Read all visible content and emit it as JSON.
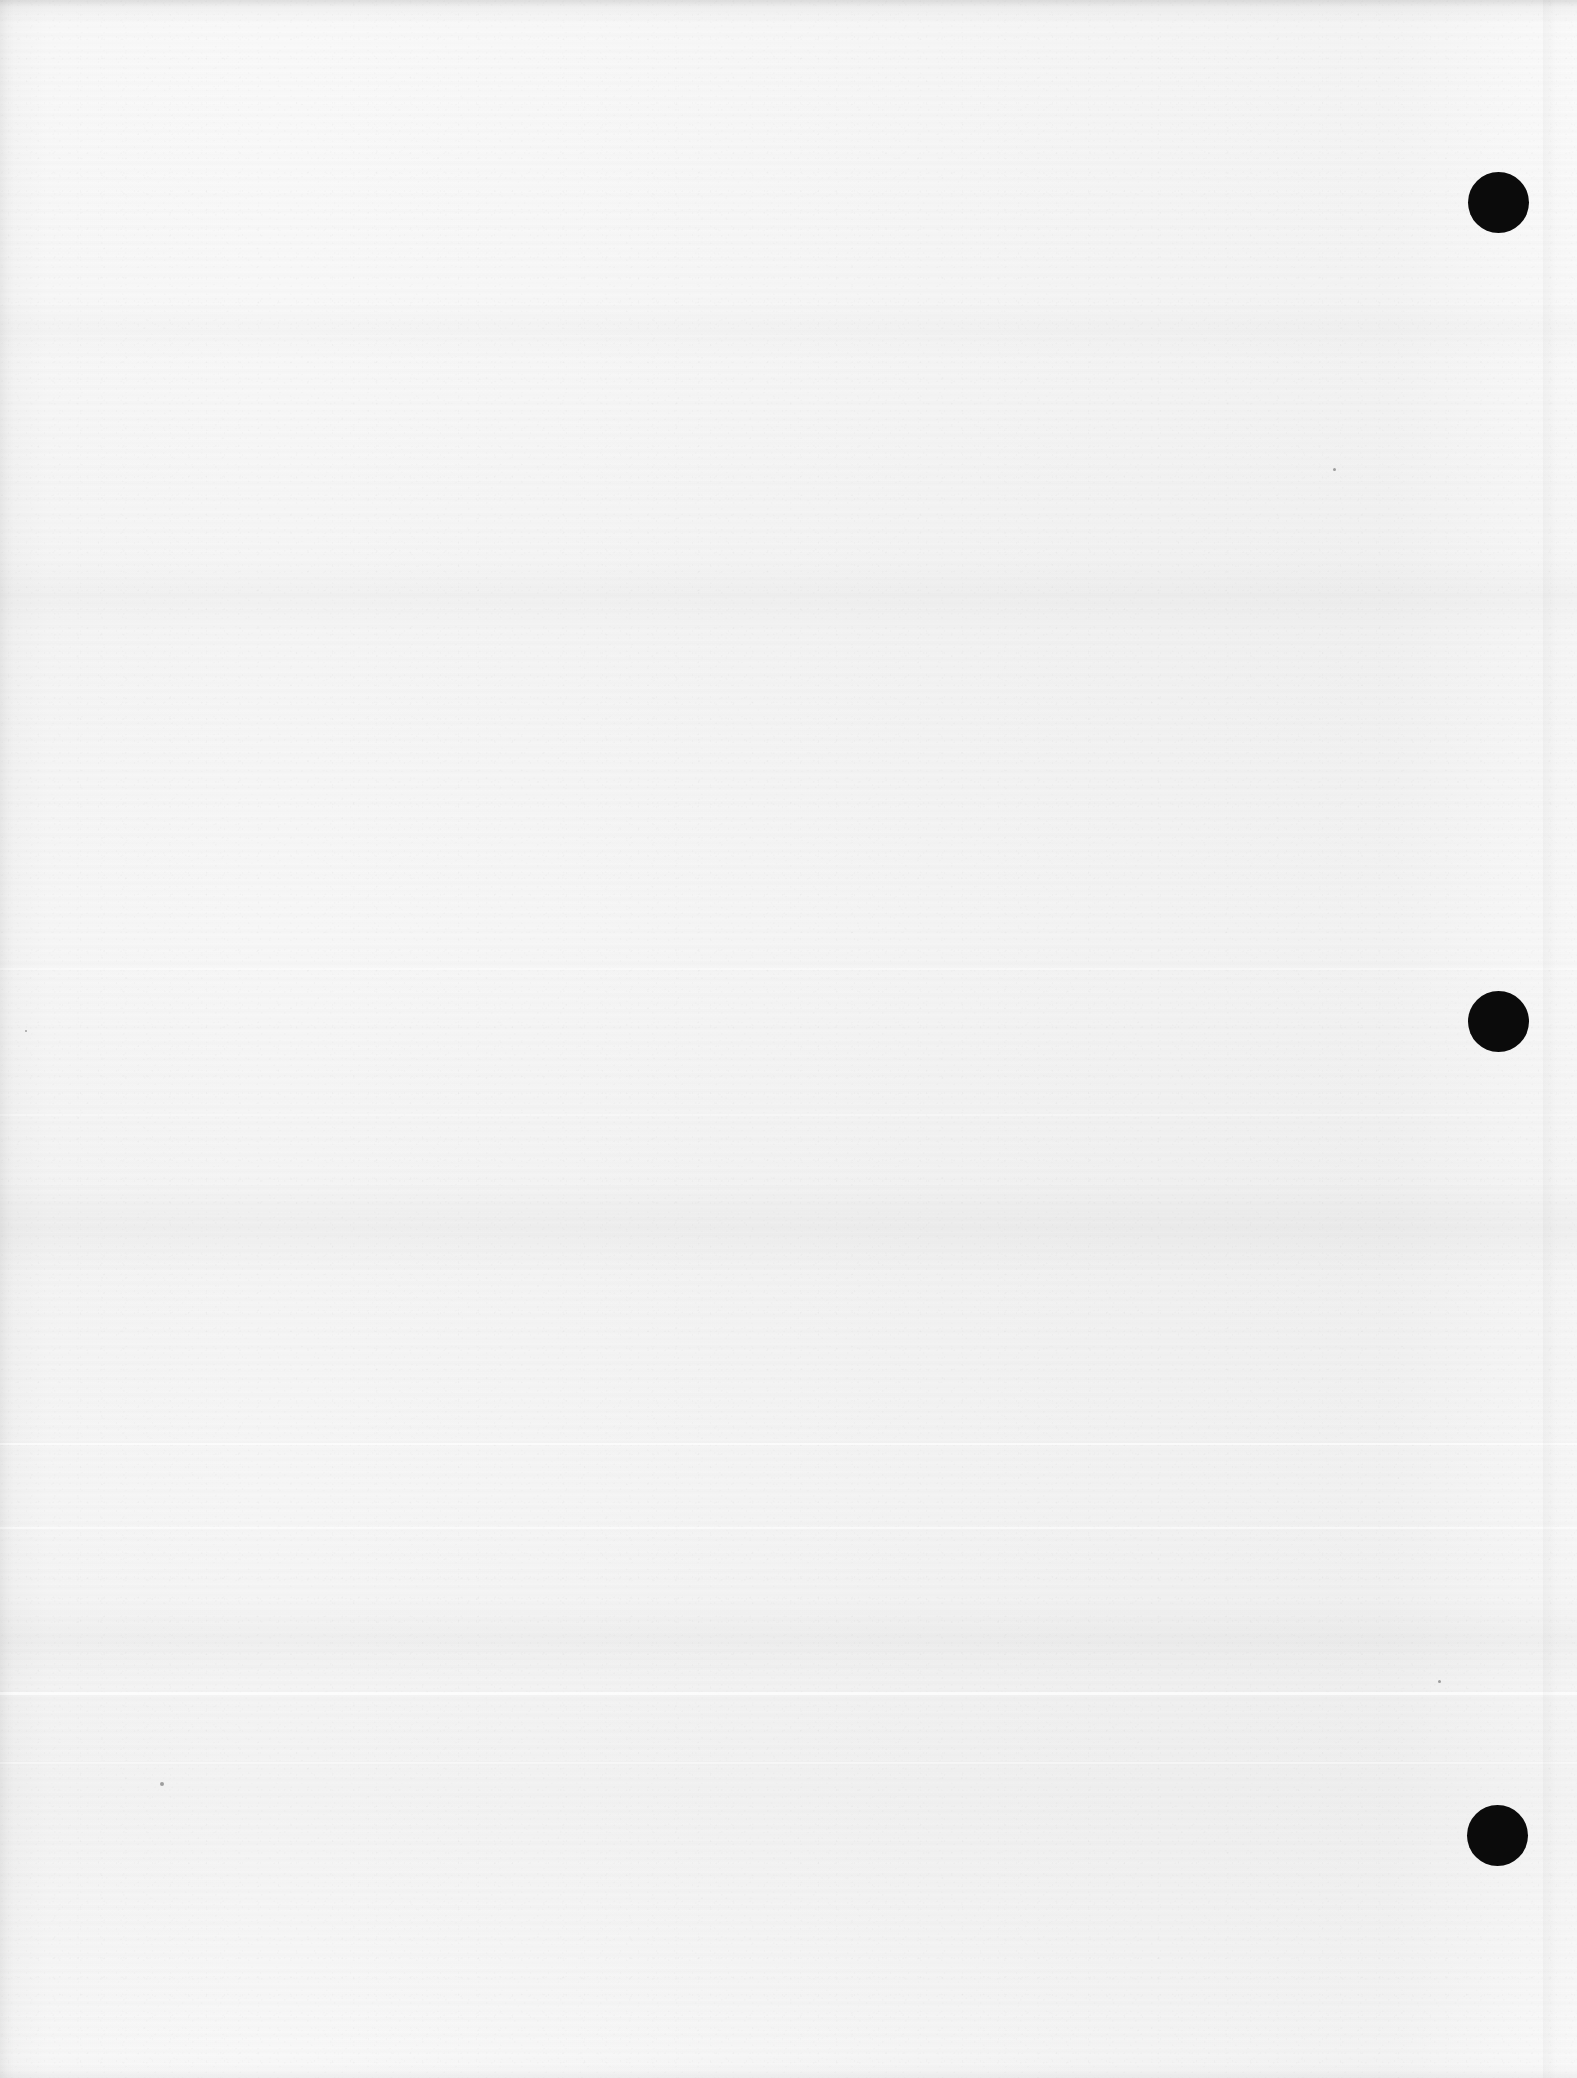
{
  "document": {
    "kind": "scanned-page",
    "title": "Scanned blank page",
    "page_width": 1577,
    "page_height": 2078,
    "content_text": "",
    "is_blank": true,
    "paper_color": "#fafafa",
    "ink_color": "#0b0b0b"
  },
  "marks": {
    "label": "punch-hole marks",
    "count": 3,
    "shape": "circle",
    "color": "#0b0b0b",
    "items": [
      {
        "name": "punch-mark-top",
        "cx": 1498,
        "cy": 202,
        "diameter": 61
      },
      {
        "name": "punch-mark-middle",
        "cx": 1498,
        "cy": 1021,
        "diameter": 61
      },
      {
        "name": "punch-mark-bottom",
        "cx": 1497,
        "cy": 1835,
        "diameter": 61
      }
    ]
  },
  "scan_artifacts": {
    "label": "scanner banding",
    "light_streaks": [
      {
        "y": 1443,
        "height": 2,
        "opacity": 0.8
      },
      {
        "y": 1527,
        "height": 2,
        "opacity": 0.6
      },
      {
        "y": 1692,
        "height": 3,
        "opacity": 0.85
      },
      {
        "y": 1762,
        "height": 2,
        "opacity": 0.55
      },
      {
        "y": 968,
        "height": 2,
        "opacity": 0.5
      },
      {
        "y": 1114,
        "height": 2,
        "opacity": 0.45
      }
    ],
    "dark_bands": [
      {
        "y": 560,
        "height": 70,
        "opacity": 0.016
      },
      {
        "y": 1180,
        "height": 95,
        "opacity": 0.02
      },
      {
        "y": 1600,
        "height": 80,
        "opacity": 0.018
      },
      {
        "y": 300,
        "height": 60,
        "opacity": 0.012
      }
    ],
    "specks": [
      {
        "x": 160,
        "y": 1782,
        "size": 4
      },
      {
        "x": 1333,
        "y": 468,
        "size": 3
      },
      {
        "x": 1438,
        "y": 1680,
        "size": 3
      },
      {
        "x": 25,
        "y": 1030,
        "size": 2
      }
    ]
  }
}
